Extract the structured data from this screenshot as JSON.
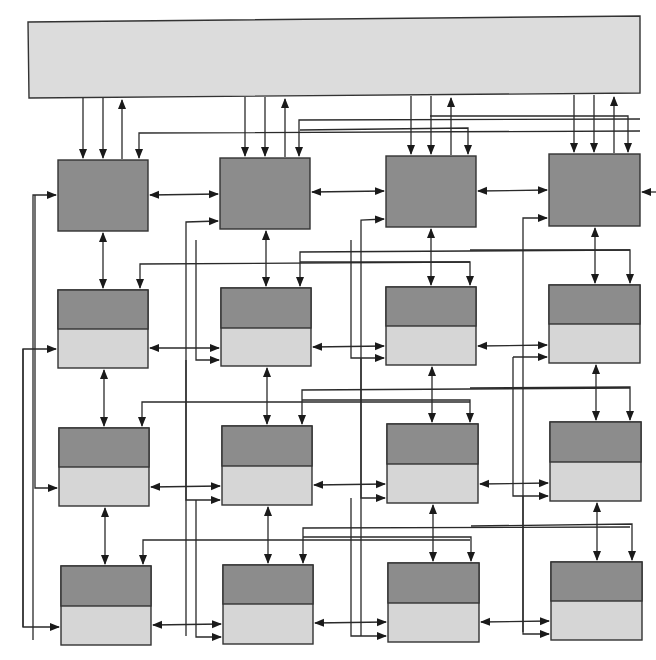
{
  "diagram": {
    "title": "",
    "colors": {
      "background": "#ffffff",
      "host_bar": "#dcdcdc",
      "node_dark": "#8c8c8c",
      "node_light": "#d6d6d6",
      "line": "#2a2a2a",
      "border": "#333333"
    },
    "host_bar": {
      "label": "",
      "x": 28,
      "y": 18,
      "w": 612,
      "h": 80
    },
    "grid": {
      "rows": 4,
      "cols": 4
    },
    "nodes": [
      {
        "row": 0,
        "col": 0,
        "x": 58,
        "y": 160,
        "w": 90,
        "h": 71,
        "split": null
      },
      {
        "row": 0,
        "col": 1,
        "x": 220,
        "y": 158,
        "w": 90,
        "h": 71,
        "split": null
      },
      {
        "row": 0,
        "col": 2,
        "x": 386,
        "y": 156,
        "w": 90,
        "h": 71,
        "split": null
      },
      {
        "row": 0,
        "col": 3,
        "x": 549,
        "y": 154,
        "w": 91,
        "h": 72,
        "split": null
      },
      {
        "row": 1,
        "col": 0,
        "x": 58,
        "y": 290,
        "w": 90,
        "h": 78,
        "split": 39
      },
      {
        "row": 1,
        "col": 1,
        "x": 221,
        "y": 288,
        "w": 90,
        "h": 78,
        "split": 40
      },
      {
        "row": 1,
        "col": 2,
        "x": 386,
        "y": 287,
        "w": 90,
        "h": 78,
        "split": 39
      },
      {
        "row": 1,
        "col": 3,
        "x": 549,
        "y": 285,
        "w": 91,
        "h": 78,
        "split": 39
      },
      {
        "row": 2,
        "col": 0,
        "x": 59,
        "y": 428,
        "w": 90,
        "h": 78,
        "split": 39
      },
      {
        "row": 2,
        "col": 1,
        "x": 222,
        "y": 426,
        "w": 90,
        "h": 79,
        "split": 40
      },
      {
        "row": 2,
        "col": 2,
        "x": 387,
        "y": 424,
        "w": 91,
        "h": 79,
        "split": 40
      },
      {
        "row": 2,
        "col": 3,
        "x": 550,
        "y": 422,
        "w": 91,
        "h": 79,
        "split": 40
      },
      {
        "row": 3,
        "col": 0,
        "x": 61,
        "y": 566,
        "w": 90,
        "h": 79,
        "split": 40
      },
      {
        "row": 3,
        "col": 1,
        "x": 223,
        "y": 565,
        "w": 90,
        "h": 79,
        "split": 39
      },
      {
        "row": 3,
        "col": 2,
        "x": 388,
        "y": 563,
        "w": 91,
        "h": 79,
        "split": 40
      },
      {
        "row": 3,
        "col": 3,
        "x": 551,
        "y": 562,
        "w": 91,
        "h": 78,
        "split": 39
      }
    ],
    "connections": {
      "host_links_per_column": [
        {
          "col": 0,
          "down_x": [
            83,
            103
          ],
          "up_x": 122,
          "top_y": 98
        },
        {
          "col": 1,
          "down_x": [
            245,
            265
          ],
          "up_x": 285,
          "top_y": 97
        },
        {
          "col": 2,
          "down_x": [
            411,
            431
          ],
          "up_x": 451,
          "top_y": 96
        },
        {
          "col": 3,
          "down_x": [
            574,
            594
          ],
          "up_x": 614,
          "top_y": 95
        }
      ],
      "vertical_bidirectional": "between vertically adjacent nodes in each column",
      "horizontal_bidirectional": "between horizontally adjacent nodes in each row",
      "skip_links": "long routed lines from each node's right-top region into downstream nodes (bypass connections)"
    }
  }
}
